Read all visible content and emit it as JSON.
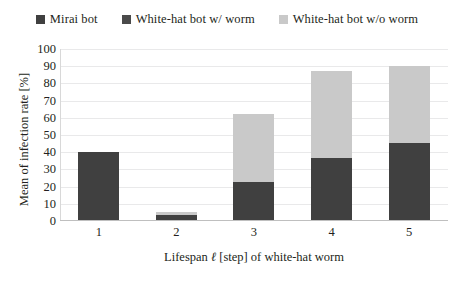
{
  "legend": {
    "position": "top",
    "entries": [
      {
        "label": "Mirai bot",
        "color": "#404040",
        "icon": "square-swatch-icon"
      },
      {
        "label": "White-hat bot w/ worm",
        "color": "#4a4a4a",
        "icon": "square-swatch-icon"
      },
      {
        "label": "White-hat bot w/o worm",
        "color": "#c9c9c9",
        "icon": "square-swatch-icon"
      }
    ]
  },
  "axes": {
    "ylabel": "Mean of infection rate [%]",
    "xlabel_prefix": "Lifespan ",
    "xlabel_symbol": "ℓ",
    "xlabel_suffix": " [step] of white-hat worm",
    "xlabel_full": "Lifespan ℓ [step] of white-hat worm",
    "yticks": [
      "100",
      "90",
      "80",
      "70",
      "60",
      "50",
      "40",
      "30",
      "20",
      "10",
      "0"
    ],
    "xticks": [
      "1",
      "2",
      "3",
      "4",
      "5"
    ]
  },
  "chart_data": {
    "type": "bar",
    "subtype": "stacked-vertical",
    "title": "",
    "xlabel": "Lifespan ℓ [step] of white-hat worm",
    "ylabel": "Mean of infection rate [%]",
    "categories": [
      "1",
      "2",
      "3",
      "4",
      "5"
    ],
    "ylim": [
      0,
      100
    ],
    "ytick_step": 10,
    "grid": true,
    "grid_axis": "y",
    "legend_position": "top",
    "series": [
      {
        "name": "Mirai bot",
        "color": "#404040",
        "values": [
          40,
          3,
          22,
          36,
          45
        ]
      },
      {
        "name": "White-hat bot w/ worm",
        "color": "#4a4a4a",
        "values": [
          0,
          0,
          0,
          0,
          0
        ]
      },
      {
        "name": "White-hat bot w/o worm",
        "color": "#c9c9c9",
        "values": [
          0,
          1.5,
          40,
          51,
          45
        ]
      }
    ],
    "totals": [
      40,
      4.5,
      62,
      87,
      90
    ]
  }
}
